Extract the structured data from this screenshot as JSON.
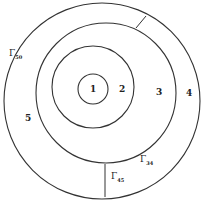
{
  "diagram": {
    "type": "concentric-regions",
    "regions": [
      {
        "id": "1",
        "label": "1"
      },
      {
        "id": "2",
        "label": "2"
      },
      {
        "id": "3",
        "label": "3"
      },
      {
        "id": "4",
        "label": "4"
      },
      {
        "id": "5",
        "label": "5"
      }
    ],
    "boundaries": [
      {
        "symbol": "Γ",
        "subscript": "50"
      },
      {
        "symbol": "Γ",
        "subscript": "34"
      },
      {
        "symbol": "Γ",
        "subscript": "45"
      }
    ],
    "stroke_color": "#333333"
  }
}
